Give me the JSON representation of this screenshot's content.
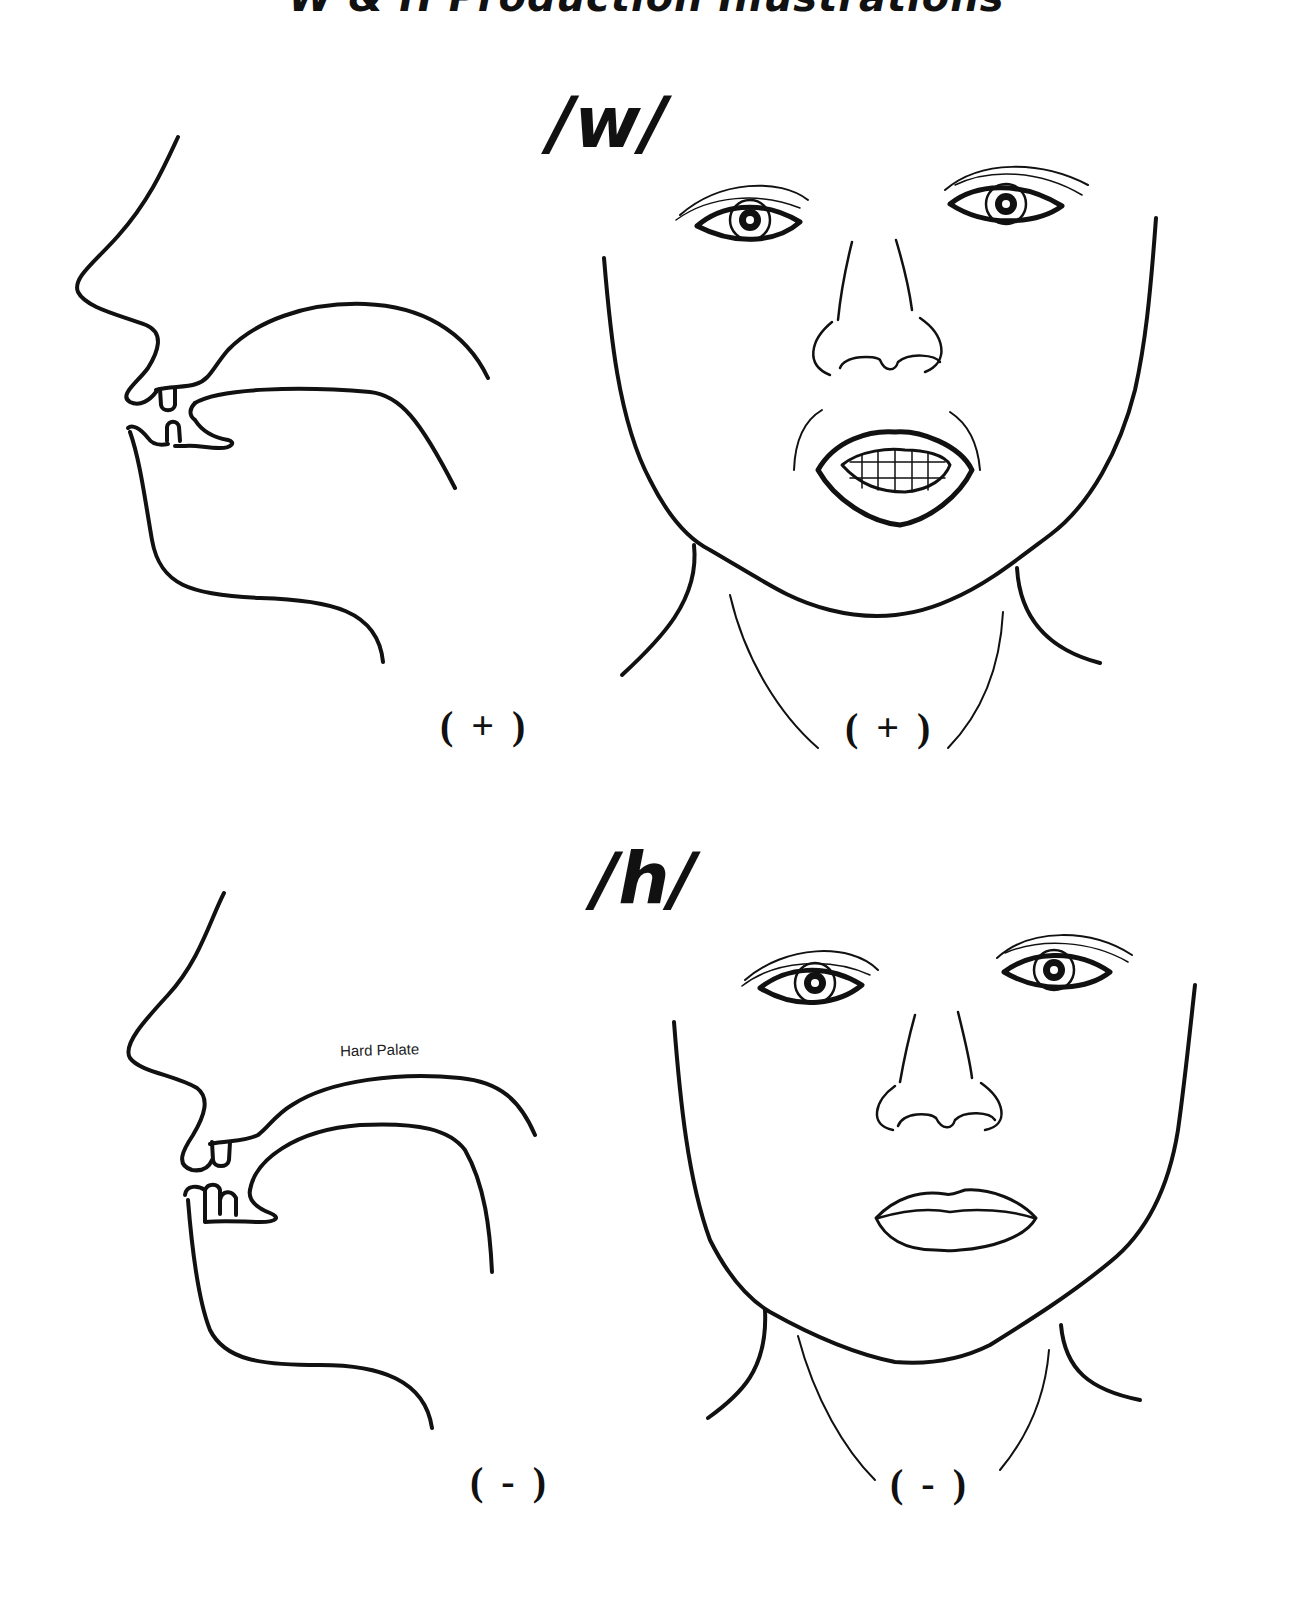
{
  "page": {
    "title": "W & H Production Illustrations"
  },
  "sections": [
    {
      "phoneme": "w",
      "phoneme_display": "/w/",
      "side_view": {
        "mark": "( + )",
        "label": ""
      },
      "front_view": {
        "mark": "( + )",
        "mouth": "open-rounded-teeth-visible"
      }
    },
    {
      "phoneme": "h",
      "phoneme_display": "/h/",
      "side_view": {
        "mark": "( - )",
        "label": "Hard Palate"
      },
      "front_view": {
        "mark": "( - )",
        "mouth": "closed-relaxed"
      }
    }
  ]
}
